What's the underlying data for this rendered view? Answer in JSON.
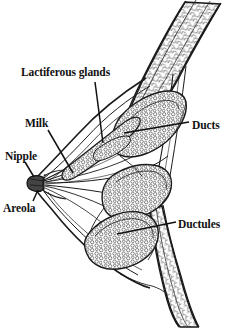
{
  "figure": {
    "background_color": "#ffffff",
    "ink_color": "#1a1a1a",
    "width": 234,
    "height": 328
  },
  "labels": {
    "lactiferous_glands": "Lactiferous glands",
    "milk": "Milk",
    "nipple": "Nipple",
    "areola": "Areola",
    "ducts": "Ducts",
    "ductules": "Ductules"
  }
}
